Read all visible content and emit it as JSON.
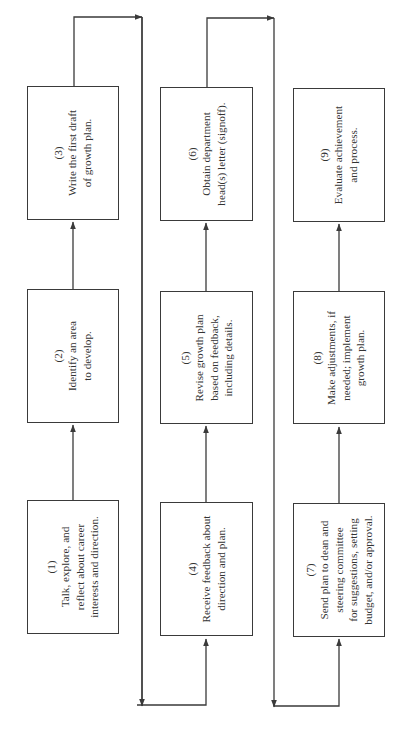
{
  "diagram": {
    "orientation": "rotated-90-ccw",
    "line_color": "#3a3a3a",
    "steps": [
      {
        "number": "(1)",
        "lines": [
          "Talk, explore, and",
          "reflect about career",
          "interests and direction."
        ]
      },
      {
        "number": "(2)",
        "lines": [
          "Identify an area",
          "to develop."
        ]
      },
      {
        "number": "(3)",
        "lines": [
          "Write the first draft",
          "of growth plan."
        ]
      },
      {
        "number": "(4)",
        "lines": [
          "Receive feedback about",
          "direction and plan."
        ]
      },
      {
        "number": "(5)",
        "lines": [
          "Revise growth plan",
          "based on feedback,",
          "including details."
        ]
      },
      {
        "number": "(6)",
        "lines": [
          "Obtain department",
          "head(s) letter (signoff)."
        ]
      },
      {
        "number": "(7)",
        "lines": [
          "Send plan to dean and",
          "steering committee",
          "for suggestions, setting",
          "budget, and/or approval."
        ]
      },
      {
        "number": "(8)",
        "lines": [
          "Make adjustments, if",
          "needed; implement",
          "growth plan."
        ]
      },
      {
        "number": "(9)",
        "lines": [
          "Evaluate achievement",
          "and process."
        ]
      }
    ],
    "flow": [
      "(1)->(2)",
      "(2)->(3)",
      "(3)->(4)",
      "(4)->(5)",
      "(5)->(6)",
      "(6)->(7)",
      "(7)->(8)",
      "(8)->(9)"
    ]
  }
}
